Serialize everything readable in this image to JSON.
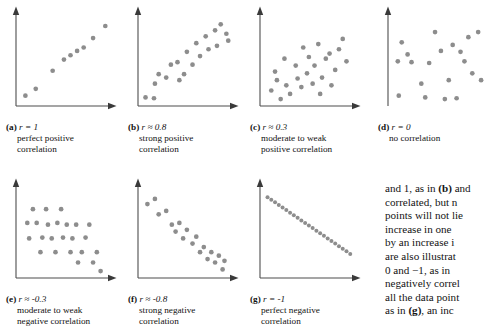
{
  "figure": {
    "type": "scatter-panel-grid",
    "dot_color": "#8d8d8d",
    "axis_color": "#4d4d4d",
    "background": "#ffffff"
  },
  "panels": [
    {
      "id": "a",
      "label": "(a)",
      "r_text": "r = 1",
      "desc_line1": "perfect positive",
      "desc_line2": "correlation",
      "has_x_axis": true,
      "points": [
        [
          10,
          12
        ],
        [
          21,
          20
        ],
        [
          39,
          41
        ],
        [
          51,
          54
        ],
        [
          58,
          59
        ],
        [
          65,
          64
        ],
        [
          72,
          68
        ],
        [
          82,
          79
        ],
        [
          95,
          93
        ]
      ]
    },
    {
      "id": "b",
      "label": "(b)",
      "r_text": "r ≈ 0.8",
      "desc_line1": "strong positive",
      "desc_line2": "correlation",
      "has_x_axis": true,
      "points": [
        [
          8,
          10
        ],
        [
          17,
          9
        ],
        [
          18,
          26
        ],
        [
          22,
          37
        ],
        [
          30,
          33
        ],
        [
          35,
          48
        ],
        [
          42,
          51
        ],
        [
          44,
          30
        ],
        [
          49,
          37
        ],
        [
          52,
          63
        ],
        [
          58,
          48
        ],
        [
          62,
          73
        ],
        [
          66,
          58
        ],
        [
          72,
          81
        ],
        [
          75,
          66
        ],
        [
          82,
          88
        ],
        [
          84,
          70
        ],
        [
          88,
          95
        ],
        [
          94,
          84
        ],
        [
          96,
          76
        ]
      ]
    },
    {
      "id": "c",
      "label": "(c)",
      "r_text": "r ≈ 0.3",
      "desc_line1": "moderate to weak",
      "desc_line2": "positive correlation",
      "has_x_axis": true,
      "points": [
        [
          12,
          18
        ],
        [
          16,
          40
        ],
        [
          18,
          30
        ],
        [
          22,
          8
        ],
        [
          26,
          55
        ],
        [
          28,
          24
        ],
        [
          32,
          14
        ],
        [
          38,
          47
        ],
        [
          40,
          32
        ],
        [
          44,
          22
        ],
        [
          46,
          68
        ],
        [
          50,
          38
        ],
        [
          52,
          57
        ],
        [
          56,
          26
        ],
        [
          58,
          47
        ],
        [
          62,
          72
        ],
        [
          64,
          14
        ],
        [
          66,
          33
        ],
        [
          70,
          55
        ],
        [
          74,
          61
        ],
        [
          76,
          24
        ],
        [
          80,
          42
        ],
        [
          84,
          66
        ],
        [
          88,
          78
        ],
        [
          92,
          52
        ]
      ]
    },
    {
      "id": "d",
      "label": "(d)",
      "r_text": "r = 0",
      "desc_line1": "no correlation",
      "desc_line2": "",
      "has_x_axis": false,
      "points": [
        [
          10,
          52
        ],
        [
          11,
          12
        ],
        [
          14,
          74
        ],
        [
          20,
          60
        ],
        [
          24,
          51
        ],
        [
          34,
          26
        ],
        [
          38,
          10
        ],
        [
          42,
          50
        ],
        [
          48,
          86
        ],
        [
          54,
          64
        ],
        [
          58,
          8
        ],
        [
          62,
          30
        ],
        [
          66,
          71
        ],
        [
          70,
          9
        ],
        [
          74,
          63
        ],
        [
          78,
          52
        ],
        [
          82,
          80
        ],
        [
          86,
          38
        ],
        [
          92,
          86
        ],
        [
          95,
          30
        ]
      ]
    },
    {
      "id": "e",
      "label": "(e)",
      "r_text": "r ≈ -0.3",
      "desc_line1": "moderate to weak",
      "desc_line2": "negative correlation",
      "has_x_axis": true,
      "points": [
        [
          12,
          64
        ],
        [
          14,
          46
        ],
        [
          18,
          80
        ],
        [
          22,
          64
        ],
        [
          26,
          30
        ],
        [
          28,
          47
        ],
        [
          32,
          80
        ],
        [
          34,
          62
        ],
        [
          38,
          46
        ],
        [
          42,
          30
        ],
        [
          44,
          64
        ],
        [
          48,
          80
        ],
        [
          50,
          47
        ],
        [
          54,
          62
        ],
        [
          58,
          30
        ],
        [
          60,
          46
        ],
        [
          64,
          62
        ],
        [
          66,
          18
        ],
        [
          70,
          30
        ],
        [
          74,
          47
        ],
        [
          78,
          62
        ],
        [
          82,
          18
        ],
        [
          86,
          30
        ],
        [
          90,
          8
        ]
      ]
    },
    {
      "id": "f",
      "label": "(f)",
      "r_text": "r ≈ -0.8",
      "desc_line1": "strong negative",
      "desc_line2": "correlation",
      "has_x_axis": true,
      "points": [
        [
          10,
          86
        ],
        [
          18,
          92
        ],
        [
          22,
          74
        ],
        [
          30,
          78
        ],
        [
          36,
          62
        ],
        [
          40,
          54
        ],
        [
          44,
          64
        ],
        [
          48,
          46
        ],
        [
          52,
          56
        ],
        [
          58,
          40
        ],
        [
          62,
          48
        ],
        [
          66,
          30
        ],
        [
          70,
          36
        ],
        [
          74,
          22
        ],
        [
          78,
          30
        ],
        [
          82,
          18
        ],
        [
          86,
          26
        ],
        [
          90,
          10
        ],
        [
          92,
          20
        ]
      ]
    },
    {
      "id": "g",
      "label": "(g)",
      "r_text": "r = -1",
      "desc_line1": "perfect negative",
      "desc_line2": "correlation",
      "has_x_axis": true,
      "points": [
        [
          8,
          94
        ],
        [
          12,
          91
        ],
        [
          16,
          88
        ],
        [
          20,
          85
        ],
        [
          24,
          82
        ],
        [
          28,
          79
        ],
        [
          32,
          76
        ],
        [
          36,
          73
        ],
        [
          40,
          70
        ],
        [
          44,
          67
        ],
        [
          48,
          64
        ],
        [
          52,
          61
        ],
        [
          56,
          58
        ],
        [
          60,
          55
        ],
        [
          64,
          52
        ],
        [
          68,
          49
        ],
        [
          72,
          46
        ],
        [
          76,
          43
        ],
        [
          80,
          40
        ],
        [
          84,
          37
        ],
        [
          88,
          34
        ],
        [
          92,
          31
        ],
        [
          96,
          28
        ]
      ]
    }
  ],
  "body_text": {
    "lines": [
      "and 1, as in (b) and",
      "correlated, but n",
      "points will not lie",
      "increase in one",
      "by an increase i",
      "are also illustrat",
      "0 and −1, as in",
      "negatively correl",
      "all the data point",
      "as in (g), an inc"
    ],
    "bold_fragments": [
      "(b)",
      "(g)"
    ]
  }
}
